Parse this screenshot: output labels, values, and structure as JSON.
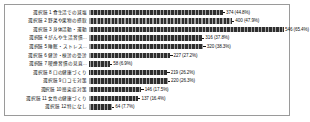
{
  "chart_data": {
    "type": "bar",
    "orientation": "horizontal",
    "title": "",
    "xlabel": "",
    "ylabel": "",
    "grid": false,
    "legend": null,
    "xlim": [
      0,
      560
    ],
    "categories": [
      "選択肢 1 食生活での減塩",
      "選択肢 2 野菜や果物の摂取",
      "選択肢 3 身体活動・運動",
      "選択肢 4 がんや生活習慣…",
      "選択肢 5 睡眠・ストレス…",
      "選択肢 6 健診・検診の受診",
      "選択肢 7 喫煙習慣の見直…",
      "選択肢 8 口の健康づくり",
      "選択肢 9 ロコモ対策",
      "選択肢 10 感染症対策",
      "選択肢 11 女性の健康づくり",
      "選択肢 12 特になし"
    ],
    "values": [
      374,
      400,
      546,
      316,
      320,
      227,
      58,
      219,
      220,
      146,
      137,
      64
    ],
    "percents": [
      44.8,
      47.9,
      65.4,
      37.8,
      38.3,
      27.2,
      6.9,
      26.2,
      26.3,
      17.5,
      16.4,
      7.7
    ],
    "value_labels": [
      "374 (44.8%)",
      "400 (47.9%)",
      "546 (65.4%)",
      "316 (37.8%)",
      "320 (38.3%)",
      "227 (27.2%)",
      "58 (6.9%)",
      "219 (26.2%)",
      "220 (26.3%)",
      "146 (17.5%)",
      "137 (16.4%)",
      "64 (7.7%)"
    ],
    "bar_color": "#2f2f2f",
    "frame_color": "#9a9a9a"
  }
}
